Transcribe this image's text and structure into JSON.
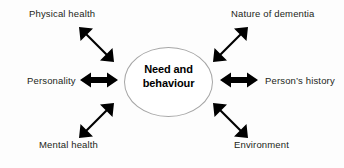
{
  "diagram": {
    "center": {
      "text": "Need and behaviour",
      "line1": "Need and",
      "line2": "behaviour",
      "shape": "ellipse",
      "outline_color": "#a6a6a6",
      "fill_color": "#ffffff"
    },
    "arrow_color": "#000000",
    "text_color": "#231f20",
    "background_color": "#fdfdfd",
    "factors": [
      {
        "label": "Physical health",
        "position": "top-left",
        "arrow": "double-headed-diagonal-nwse"
      },
      {
        "label": "Nature of dementia",
        "position": "top-right",
        "arrow": "double-headed-diagonal-nesw"
      },
      {
        "label": "Personality",
        "position": "middle-left",
        "arrow": "double-headed-horizontal"
      },
      {
        "label": "Person’s history",
        "position": "middle-right",
        "arrow": "double-headed-horizontal"
      },
      {
        "label": "Mental health",
        "position": "bottom-left",
        "arrow": "double-headed-diagonal-nesw"
      },
      {
        "label": "Environment",
        "position": "bottom-right",
        "arrow": "double-headed-diagonal-nwse"
      }
    ]
  }
}
